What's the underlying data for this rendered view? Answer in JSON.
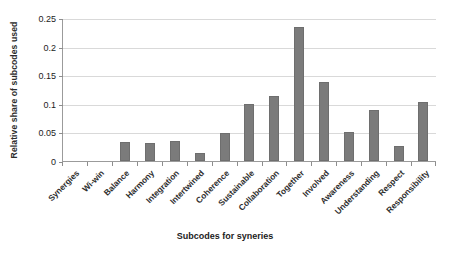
{
  "chart_data": {
    "type": "bar",
    "title": "",
    "subtitle": "",
    "xlabel": "Subcodes for syneries",
    "ylabel": "Relative share of subcodes used",
    "categories": [
      "Synergies",
      "Wi-win",
      "Balance",
      "Harmony",
      "Integration",
      "Intertwined",
      "Coherence",
      "Sustainable",
      "Collaboration",
      "Together",
      "Involved",
      "Awareness",
      "Understanding",
      "Respect",
      "Responsibility"
    ],
    "values": [
      0,
      0,
      0.034,
      0.031,
      0.035,
      0.014,
      0.049,
      0.099,
      0.114,
      0.235,
      0.138,
      0.05,
      0.089,
      0.027,
      0.103
    ],
    "ylim": [
      0,
      0.25
    ],
    "ytick_labels": [
      "0",
      "0.05",
      "0.1",
      "0.15",
      "0.2",
      "0.25"
    ],
    "ytick_values": [
      0,
      0.05,
      0.1,
      0.15,
      0.2,
      0.25
    ],
    "grid": true,
    "legend": "none",
    "bar_color": "#7b7b7b",
    "gridline_color": "#d9d9d9",
    "axis_color": "#9b9b9b"
  }
}
